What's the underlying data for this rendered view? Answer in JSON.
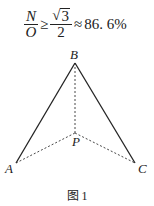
{
  "formula": {
    "lhs_num": "N",
    "lhs_den": "O",
    "relation": "≥",
    "sqrt_sign": "√",
    "sqrt_value": "3",
    "rhs_den": "2",
    "approx": "≈",
    "result": "86. 6%"
  },
  "figure": {
    "points": {
      "A": {
        "label": "A",
        "x": 16,
        "y": 163
      },
      "B": {
        "label": "B",
        "x": 75,
        "y": 63
      },
      "C": {
        "label": "C",
        "x": 135,
        "y": 163
      },
      "P": {
        "label": "P",
        "x": 75,
        "y": 133
      }
    },
    "solid_edges": [
      [
        "A",
        "B"
      ],
      [
        "B",
        "C"
      ]
    ],
    "dashed_edges": [
      [
        "B",
        "P"
      ],
      [
        "A",
        "P"
      ],
      [
        "P",
        "C"
      ]
    ],
    "caption": "图 1"
  }
}
